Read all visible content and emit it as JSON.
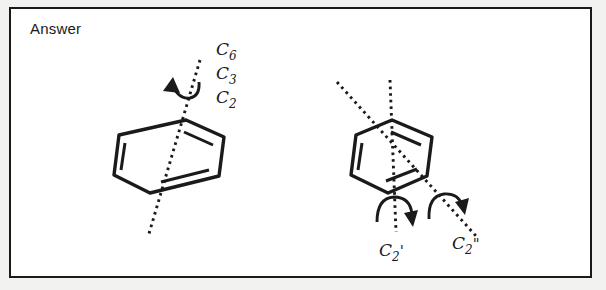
{
  "panel": {
    "heading": "Answer",
    "background_color": "#ffffff",
    "border_color": "#1a1a1a",
    "margin_color": "#f2f2f0",
    "ink_color": "#1a1a1a"
  },
  "figure": {
    "structures": [
      {
        "id": "principal-axis-structure",
        "molecule": "benzene",
        "molecule_depiction": "hexagon-perspective",
        "axis_count": 1,
        "rotation_arrow_count": 1,
        "axis_labels": [
          {
            "symbol": "C",
            "order": "6",
            "prime": "",
            "text": "C6"
          },
          {
            "symbol": "C",
            "order": "3",
            "prime": "",
            "text": "C3"
          },
          {
            "symbol": "C",
            "order": "2",
            "prime": "",
            "text": "C2"
          }
        ]
      },
      {
        "id": "secondary-axis-structure",
        "molecule": "benzene",
        "molecule_depiction": "hexagon-perspective",
        "axis_count": 2,
        "rotation_arrow_count": 2,
        "axis_labels": [
          {
            "symbol": "C",
            "order": "2",
            "prime": "'",
            "text": "C2'"
          },
          {
            "symbol": "C",
            "order": "2",
            "prime": "\"",
            "text": "C2\""
          }
        ]
      }
    ]
  },
  "icons": {
    "rotation_arrow": "curved-rotation-arrow",
    "axis": "dotted-axis-line",
    "ring": "benzene-ring"
  }
}
